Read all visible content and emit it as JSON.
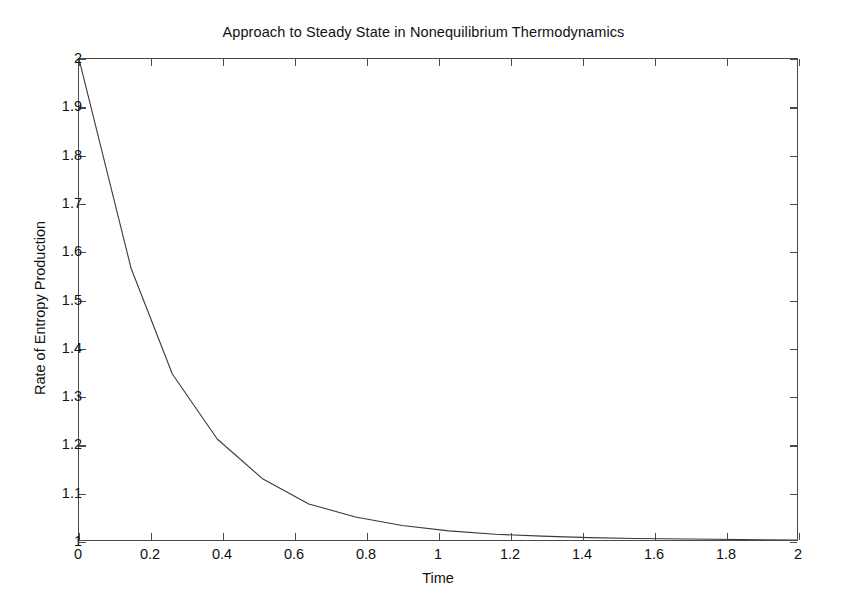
{
  "chart_data": {
    "type": "line",
    "title": "Approach to Steady State in Nonequilibrium Thermodynamics",
    "xlabel": "Time",
    "ylabel": "Rate of Entropy Production",
    "xlim": [
      0,
      2
    ],
    "ylim": [
      1,
      2
    ],
    "grid": false,
    "legend": null,
    "xticks": [
      0,
      0.2,
      0.4,
      0.6,
      0.8,
      1,
      1.2,
      1.4,
      1.6,
      1.8,
      2
    ],
    "xtick_labels": [
      "0",
      "0.2",
      "0.4",
      "0.6",
      "0.8",
      "1",
      "1.2",
      "1.4",
      "1.6",
      "1.8",
      "2"
    ],
    "yticks": [
      1,
      1.1,
      1.2,
      1.3,
      1.4,
      1.5,
      1.6,
      1.7,
      1.8,
      1.9,
      2
    ],
    "ytick_labels": [
      "1",
      "1.1",
      "1.2",
      "1.3",
      "1.4",
      "1.5",
      "1.6",
      "1.7",
      "1.8",
      "1.9",
      "2"
    ],
    "series": [
      {
        "name": "Rate of Entropy Production",
        "color": "#3a3a3a",
        "line_width": 1.1,
        "x": [
          0,
          0.145,
          0.26,
          0.385,
          0.51,
          0.64,
          0.77,
          0.9,
          1.03,
          1.16,
          1.29,
          1.42,
          1.55,
          1.7,
          1.85,
          2
        ],
        "y": [
          2.0,
          1.565,
          1.345,
          1.21,
          1.128,
          1.075,
          1.048,
          1.03,
          1.019,
          1.012,
          1.008,
          1.005,
          1.003,
          1.002,
          1.001,
          1.0
        ]
      }
    ]
  },
  "axes": {
    "frame_color": "#4a4a4a"
  }
}
